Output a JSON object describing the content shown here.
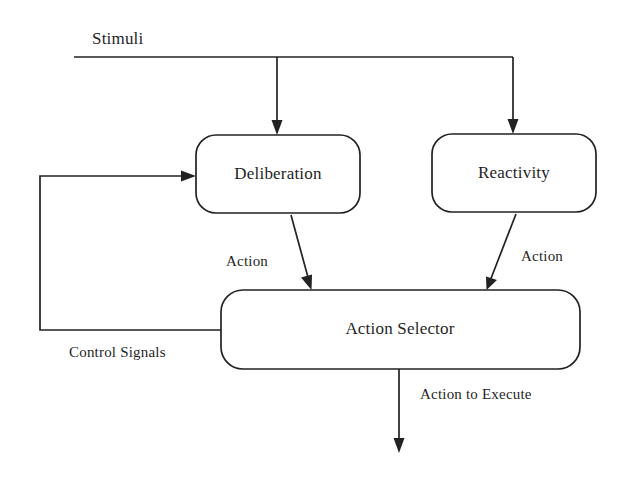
{
  "diagram": {
    "type": "flow-diagram",
    "background_color": "#ffffff",
    "stroke_color": "#222222",
    "text_color": "#1f1f1f",
    "input_label": "Stimuli",
    "nodes": [
      {
        "id": "deliberation",
        "label": "Deliberation",
        "shape": "rounded-rectangle"
      },
      {
        "id": "reactivity",
        "label": "Reactivity",
        "shape": "rounded-rectangle"
      },
      {
        "id": "action_selector",
        "label": "Action Selector",
        "shape": "rounded-rectangle"
      }
    ],
    "edges": [
      {
        "id": "stimuli-to-deliberation",
        "from": "Stimuli",
        "to": "Deliberation",
        "label": ""
      },
      {
        "id": "stimuli-to-reactivity",
        "from": "Stimuli",
        "to": "Reactivity",
        "label": ""
      },
      {
        "id": "deliberation-to-selector",
        "from": "Deliberation",
        "to": "Action Selector",
        "label": "Action"
      },
      {
        "id": "reactivity-to-selector",
        "from": "Reactivity",
        "to": "Action Selector",
        "label": "Action"
      },
      {
        "id": "selector-to-deliberation",
        "from": "Action Selector",
        "to": "Deliberation",
        "label": "Control Signals"
      },
      {
        "id": "selector-output",
        "from": "Action Selector",
        "to": "",
        "label": "Action to Execute"
      }
    ],
    "labels": {
      "stimuli": "Stimuli",
      "deliberation": "Deliberation",
      "reactivity": "Reactivity",
      "action_selector": "Action Selector",
      "action_left": "Action",
      "action_right": "Action",
      "control_signals": "Control Signals",
      "action_to_execute": "Action to Execute"
    }
  }
}
